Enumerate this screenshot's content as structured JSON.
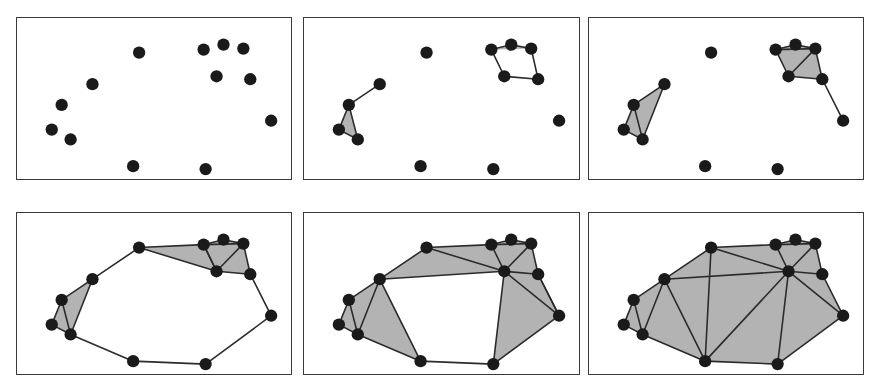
{
  "figure": {
    "panel_count": 6,
    "rows": 2,
    "columns": 3,
    "background_color": "#ffffff",
    "panel_border_color": "#3a3a3a",
    "vertex_color": "#1a1a1a",
    "edge_color": "#2b2b2b",
    "triangle_fill_color": "#b3b3b3",
    "vertex_radius": 6.2,
    "edge_width": 1.6
  },
  "chart_data": {
    "type": "scatter",
    "xlabel": "",
    "ylabel": "",
    "xlim": [
      0,
      276
    ],
    "ylim": [
      0,
      163
    ],
    "grid": false,
    "legend": "none",
    "points": [
      {
        "id": 0,
        "x": 123,
        "y": 35
      },
      {
        "id": 1,
        "x": 188,
        "y": 32
      },
      {
        "id": 2,
        "x": 208,
        "y": 27
      },
      {
        "id": 3,
        "x": 228,
        "y": 31
      },
      {
        "id": 4,
        "x": 201,
        "y": 59
      },
      {
        "id": 5,
        "x": 235,
        "y": 62
      },
      {
        "id": 6,
        "x": 256,
        "y": 104
      },
      {
        "id": 7,
        "x": 76,
        "y": 67
      },
      {
        "id": 8,
        "x": 45,
        "y": 88
      },
      {
        "id": 9,
        "x": 35,
        "y": 113
      },
      {
        "id": 10,
        "x": 54,
        "y": 123
      },
      {
        "id": 11,
        "x": 117,
        "y": 150
      },
      {
        "id": 12,
        "x": 190,
        "y": 153
      }
    ],
    "series": [
      {
        "name": "Panel 1 — scale 0 (points only)",
        "panel_index": 0,
        "row": 0,
        "column": 0,
        "edges": [],
        "triangles": []
      },
      {
        "name": "Panel 2 — small scale (first edges and triangles)",
        "panel_index": 1,
        "row": 0,
        "column": 1,
        "edges": [
          [
            7,
            8
          ],
          [
            8,
            9
          ],
          [
            8,
            10
          ],
          [
            9,
            10
          ],
          [
            1,
            2
          ],
          [
            2,
            3
          ],
          [
            1,
            4
          ],
          [
            3,
            5
          ],
          [
            4,
            5
          ]
        ],
        "triangles": [
          [
            8,
            9,
            10
          ],
          [
            1,
            2,
            3
          ]
        ]
      },
      {
        "name": "Panel 3 — medium scale (clusters fill in)",
        "panel_index": 2,
        "row": 0,
        "column": 2,
        "edges": [
          [
            7,
            8
          ],
          [
            8,
            9
          ],
          [
            8,
            10
          ],
          [
            9,
            10
          ],
          [
            7,
            10
          ],
          [
            1,
            2
          ],
          [
            2,
            3
          ],
          [
            1,
            4
          ],
          [
            3,
            5
          ],
          [
            4,
            5
          ],
          [
            1,
            3
          ],
          [
            3,
            4
          ],
          [
            5,
            6
          ]
        ],
        "triangles": [
          [
            8,
            9,
            10
          ],
          [
            7,
            8,
            10
          ],
          [
            1,
            2,
            3
          ],
          [
            1,
            3,
            4
          ],
          [
            3,
            4,
            5
          ]
        ]
      },
      {
        "name": "Panel 4 — larger scale (cycle closes, annulus visible)",
        "panel_index": 3,
        "row": 1,
        "column": 0,
        "edges": [
          [
            0,
            7
          ],
          [
            0,
            1
          ],
          [
            7,
            8
          ],
          [
            8,
            9
          ],
          [
            8,
            10
          ],
          [
            9,
            10
          ],
          [
            7,
            10
          ],
          [
            10,
            11
          ],
          [
            11,
            12
          ],
          [
            12,
            6
          ],
          [
            6,
            5
          ],
          [
            1,
            2
          ],
          [
            2,
            3
          ],
          [
            1,
            4
          ],
          [
            3,
            5
          ],
          [
            4,
            5
          ],
          [
            1,
            3
          ],
          [
            3,
            4
          ],
          [
            0,
            4
          ],
          [
            4,
            1
          ]
        ],
        "triangles": [
          [
            8,
            9,
            10
          ],
          [
            7,
            8,
            10
          ],
          [
            1,
            2,
            3
          ],
          [
            1,
            3,
            4
          ],
          [
            3,
            4,
            5
          ],
          [
            0,
            1,
            4
          ]
        ]
      },
      {
        "name": "Panel 5 — still larger scale (one hole remains)",
        "panel_index": 4,
        "row": 1,
        "column": 1,
        "edges": [
          [
            0,
            7
          ],
          [
            0,
            1
          ],
          [
            7,
            8
          ],
          [
            8,
            9
          ],
          [
            8,
            10
          ],
          [
            9,
            10
          ],
          [
            7,
            10
          ],
          [
            10,
            11
          ],
          [
            11,
            12
          ],
          [
            12,
            6
          ],
          [
            6,
            5
          ],
          [
            1,
            2
          ],
          [
            2,
            3
          ],
          [
            1,
            4
          ],
          [
            3,
            5
          ],
          [
            4,
            5
          ],
          [
            1,
            3
          ],
          [
            3,
            4
          ],
          [
            0,
            4
          ],
          [
            7,
            11
          ],
          [
            4,
            7
          ],
          [
            4,
            12
          ],
          [
            4,
            6
          ],
          [
            5,
            6
          ]
        ],
        "triangles": [
          [
            8,
            9,
            10
          ],
          [
            7,
            8,
            10
          ],
          [
            1,
            2,
            3
          ],
          [
            1,
            3,
            4
          ],
          [
            3,
            4,
            5
          ],
          [
            0,
            1,
            4
          ],
          [
            0,
            4,
            7
          ],
          [
            7,
            10,
            11
          ],
          [
            4,
            6,
            12
          ],
          [
            4,
            5,
            6
          ]
        ]
      },
      {
        "name": "Panel 6 — largest scale (complex fully fills in)",
        "panel_index": 5,
        "row": 1,
        "column": 2,
        "edges": [
          [
            0,
            7
          ],
          [
            0,
            1
          ],
          [
            7,
            8
          ],
          [
            8,
            9
          ],
          [
            8,
            10
          ],
          [
            9,
            10
          ],
          [
            7,
            10
          ],
          [
            10,
            11
          ],
          [
            11,
            12
          ],
          [
            12,
            6
          ],
          [
            6,
            5
          ],
          [
            1,
            2
          ],
          [
            2,
            3
          ],
          [
            1,
            4
          ],
          [
            3,
            5
          ],
          [
            4,
            5
          ],
          [
            1,
            3
          ],
          [
            3,
            4
          ],
          [
            0,
            4
          ],
          [
            7,
            11
          ],
          [
            4,
            7
          ],
          [
            4,
            12
          ],
          [
            4,
            6
          ],
          [
            4,
            11
          ],
          [
            0,
            11
          ]
        ],
        "triangles": [
          [
            8,
            9,
            10
          ],
          [
            7,
            8,
            10
          ],
          [
            1,
            2,
            3
          ],
          [
            1,
            3,
            4
          ],
          [
            3,
            4,
            5
          ],
          [
            0,
            1,
            4
          ],
          [
            0,
            4,
            7
          ],
          [
            7,
            10,
            11
          ],
          [
            4,
            6,
            12
          ],
          [
            4,
            5,
            6
          ],
          [
            0,
            7,
            11
          ],
          [
            0,
            4,
            11
          ],
          [
            4,
            11,
            12
          ]
        ]
      }
    ]
  },
  "panels": [
    {
      "name": "panel-1",
      "label": "Panel 1"
    },
    {
      "name": "panel-2",
      "label": "Panel 2"
    },
    {
      "name": "panel-3",
      "label": "Panel 3"
    },
    {
      "name": "panel-4",
      "label": "Panel 4"
    },
    {
      "name": "panel-5",
      "label": "Panel 5"
    },
    {
      "name": "panel-6",
      "label": "Panel 6"
    }
  ]
}
